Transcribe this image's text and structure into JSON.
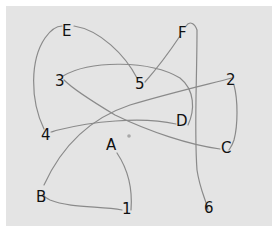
{
  "diagram": {
    "type": "connect-the-dots trail",
    "nodes": [
      {
        "id": "1",
        "label": "1"
      },
      {
        "id": "A",
        "label": "A"
      },
      {
        "id": "2",
        "label": "2"
      },
      {
        "id": "B",
        "label": "B"
      },
      {
        "id": "3",
        "label": "3"
      },
      {
        "id": "C",
        "label": "C"
      },
      {
        "id": "4",
        "label": "4"
      },
      {
        "id": "D",
        "label": "D"
      },
      {
        "id": "5",
        "label": "5"
      },
      {
        "id": "E",
        "label": "E"
      },
      {
        "id": "6",
        "label": "6"
      },
      {
        "id": "F",
        "label": "F"
      }
    ],
    "edges": [
      [
        "A",
        "1"
      ],
      [
        "1",
        "B"
      ],
      [
        "B",
        "2"
      ],
      [
        "2",
        "C"
      ],
      [
        "C",
        "3"
      ],
      [
        "3",
        "D"
      ],
      [
        "D",
        "4"
      ],
      [
        "4",
        "E"
      ],
      [
        "E",
        "5"
      ],
      [
        "5",
        "F"
      ],
      [
        "F",
        "6"
      ]
    ],
    "colors": {
      "paper": "#e4e4e4",
      "line": "#8a8a8a",
      "text": "#111111"
    }
  }
}
